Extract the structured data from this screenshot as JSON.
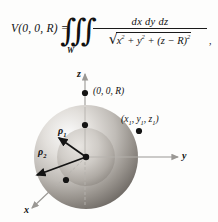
{
  "figure": {
    "formula": {
      "function_name": "V",
      "lhs": "V(0, 0, R)  =",
      "integral_glyphs": "∭",
      "integral_subscript": "W",
      "numerator": "dx dy dz",
      "radical_glyph": "√",
      "denominator_terms": "x² + y² + (z − R)²",
      "denom_x": "x",
      "denom_plus1": "+",
      "denom_y": "y",
      "denom_plus2": "+ (",
      "denom_z": "z",
      "denom_minus": "−",
      "denom_R": "R",
      "denom_close": ")",
      "exp_two": "2",
      "trailing_punctuation": ","
    },
    "diagram": {
      "axes": [
        {
          "name": "z-axis",
          "label": "z"
        },
        {
          "name": "y-axis",
          "label": "y"
        },
        {
          "name": "x-axis",
          "label": "x"
        }
      ],
      "points": [
        {
          "name": "point-0-0-R",
          "label": "(0, 0, R)"
        },
        {
          "name": "point-x1-y1-z1",
          "label": "(x",
          "sub1": "1",
          "mid1": ", y",
          "sub2": "1",
          "mid2": ", z",
          "sub3": "1",
          "close": ")"
        }
      ],
      "radii": [
        {
          "name": "rho-1",
          "symbol": "ρ",
          "subscript": "1"
        },
        {
          "name": "rho-2",
          "symbol": "ρ",
          "subscript": "2"
        }
      ],
      "colors": {
        "sphere_light": "#f2f0ee",
        "sphere_mid": "#b8b4b0",
        "sphere_dark": "#6e6a66",
        "axis": "#9a9894",
        "ink": "#141414"
      }
    }
  }
}
